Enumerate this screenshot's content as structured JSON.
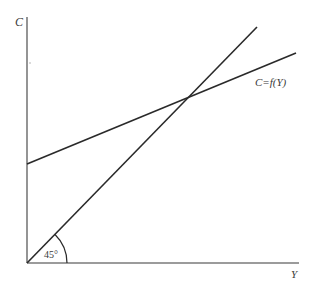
{
  "diagram": {
    "type": "keynesian-cross",
    "axes": {
      "y_label": "C",
      "x_label": "Y",
      "origin": [
        27,
        263
      ],
      "y_top": [
        27,
        17
      ],
      "x_end": [
        299,
        263
      ],
      "color": "#7a7a7a"
    },
    "lines": [
      {
        "name": "45-degree-line",
        "from": [
          27,
          263
        ],
        "to": [
          257,
          27
        ],
        "color": "#2a2a2a"
      },
      {
        "name": "consumption-function",
        "label": "C=f(Y)",
        "from": [
          27,
          164
        ],
        "to": [
          296,
          53
        ],
        "color": "#2a2a2a"
      }
    ],
    "intersection": [
      185,
      98
    ],
    "angle_annotation": {
      "label": "45°",
      "arc_radius": 40
    }
  }
}
